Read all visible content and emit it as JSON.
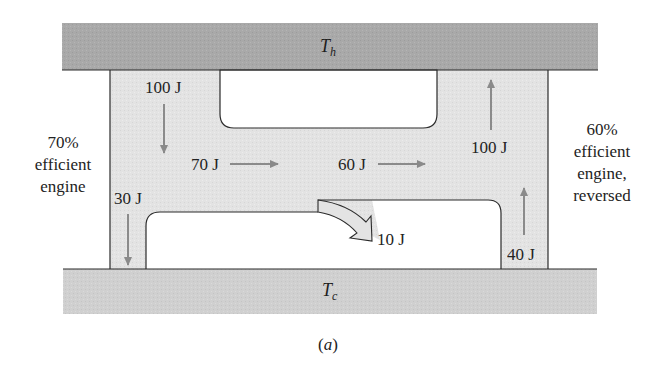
{
  "figure": {
    "caption_letter": "a",
    "hot_reservoir": {
      "symbol": "T",
      "subscript": "h",
      "fill": "#a9a9a9"
    },
    "cold_reservoir": {
      "symbol": "T",
      "subscript": "c",
      "fill": "#d0d0d0"
    },
    "engine_body_fill": "#e2e2e2",
    "arrow_color": "#8a8a8a",
    "left_engine": {
      "label_lines": [
        "70%",
        "efficient",
        "engine"
      ],
      "heat_in": "100 J",
      "work_out": "70 J",
      "heat_out": "30 J"
    },
    "right_engine": {
      "label_lines": [
        "60%",
        "efficient",
        "engine,",
        "reversed"
      ],
      "work_in": "60 J",
      "heat_out": "100 J",
      "heat_in": "40 J"
    },
    "excess_work": "10 J"
  }
}
